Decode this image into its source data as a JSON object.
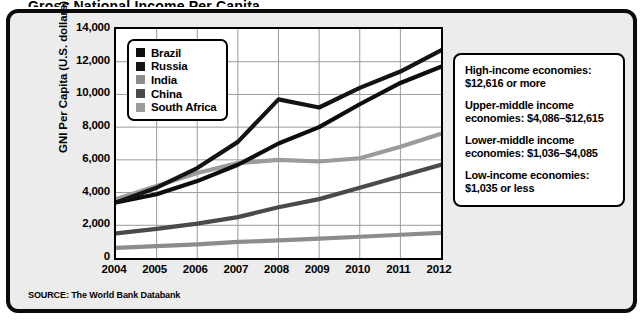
{
  "figure": {
    "title_clipped": "Gross National Income Per Capita",
    "source_note": "SOURCE: The World Bank Databank"
  },
  "legend": {
    "entries": [
      {
        "label": "Brazil",
        "color": "#0d0d0d",
        "swatch_name": "legend-swatch-brazil"
      },
      {
        "label": "Russia",
        "color": "#141414",
        "swatch_name": "legend-swatch-russia"
      },
      {
        "label": "India",
        "color": "#8c8c8c",
        "swatch_name": "legend-swatch-india"
      },
      {
        "label": "China",
        "color": "#4a4a4a",
        "swatch_name": "legend-swatch-china"
      },
      {
        "label": "South Africa",
        "color": "#9b9b9b",
        "swatch_name": "legend-swatch-south-africa"
      }
    ]
  },
  "info_box": {
    "items": [
      "High-income economies: $12,616 or more",
      "Upper-middle income economies: $4,086–$12,615",
      "Lower-middle income economies: $1,036–$4,085",
      "Low-income economies: $1,035 or less"
    ]
  },
  "chart_data": {
    "type": "line",
    "title": "Gross National Income Per Capita",
    "xlabel": "",
    "ylabel": "GNI Per Capita (U.S. dollars)",
    "categories": [
      "2004",
      "2005",
      "2006",
      "2007",
      "2008",
      "2009",
      "2010",
      "2011",
      "2012"
    ],
    "x": [
      2004,
      2005,
      2006,
      2007,
      2008,
      2009,
      2010,
      2011,
      2012
    ],
    "xlim": [
      2004,
      2012
    ],
    "ylim": [
      0,
      14000
    ],
    "yticks": [
      0,
      2000,
      4000,
      6000,
      8000,
      10000,
      12000,
      14000
    ],
    "ytick_labels": [
      "0",
      "2,000",
      "4,000",
      "6,000",
      "8,000",
      "10,000",
      "12,000",
      "14,000"
    ],
    "grid": true,
    "legend_position": "upper-left-inside",
    "series": [
      {
        "name": "Brazil",
        "color": "#0d0d0d",
        "values": [
          3400,
          3900,
          4700,
          5700,
          7000,
          8000,
          9400,
          10700,
          11700
        ]
      },
      {
        "name": "Russia",
        "color": "#141414",
        "values": [
          3400,
          4300,
          5500,
          7100,
          9700,
          9200,
          10400,
          11400,
          12700
        ]
      },
      {
        "name": "India",
        "color": "#8c8c8c",
        "values": [
          620,
          730,
          830,
          980,
          1080,
          1180,
          1300,
          1420,
          1530
        ]
      },
      {
        "name": "China",
        "color": "#4a4a4a",
        "values": [
          1500,
          1780,
          2100,
          2500,
          3100,
          3600,
          4300,
          5000,
          5700
        ]
      },
      {
        "name": "South Africa",
        "color": "#9b9b9b",
        "values": [
          3600,
          4400,
          5200,
          5800,
          6000,
          5900,
          6100,
          6800,
          7600
        ]
      }
    ]
  }
}
